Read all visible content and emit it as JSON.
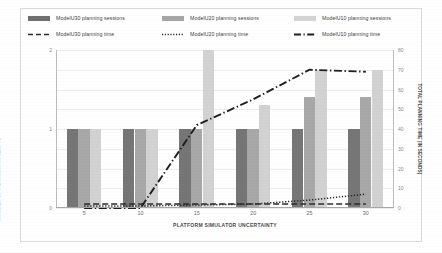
{
  "chart_data": {
    "type": "bar",
    "title": "",
    "xlabel": "PLATFORM SIMULATOR UNCERTAINTY",
    "ylabel": "NUMBER OF PLANNING ATTEMPTS",
    "y2label": "TOTAL PLANNING TIME (IN SECONDS)",
    "categories": [
      "5",
      "10",
      "15",
      "20",
      "25",
      "30"
    ],
    "x": [
      5,
      10,
      15,
      20,
      25,
      30
    ],
    "ylim": [
      0,
      2
    ],
    "y2lim": [
      0,
      80
    ],
    "yticks": [
      "0",
      "1",
      "2"
    ],
    "ytick_values": [
      0,
      1,
      2
    ],
    "y2ticks": [
      "0",
      "10",
      "20",
      "30",
      "40",
      "50",
      "60",
      "70",
      "80"
    ],
    "y2tick_values": [
      0,
      10,
      20,
      30,
      40,
      50,
      60,
      70,
      80
    ],
    "grid": true,
    "legend_position": "top",
    "series": [
      {
        "name": "ModelU30 planning sessions",
        "kind": "bar",
        "axis": "left",
        "color": "#767676",
        "values": [
          1,
          1,
          1,
          1,
          1,
          1
        ]
      },
      {
        "name": "ModelU20 planning sessions",
        "kind": "bar",
        "axis": "left",
        "color": "#a8a8a8",
        "values": [
          1,
          1,
          1,
          1,
          1.4,
          1.4
        ]
      },
      {
        "name": "ModelU10 planning sessions",
        "kind": "bar",
        "axis": "left",
        "color": "#d2d2d2",
        "values": [
          1,
          1,
          2,
          1.3,
          1.75,
          1.75
        ]
      },
      {
        "name": "ModelU30 planning time",
        "kind": "line",
        "axis": "right",
        "style": "dashed",
        "color": "#2b2b2b",
        "values": [
          2,
          2,
          2,
          2,
          2,
          2
        ]
      },
      {
        "name": "ModelU20 planning time",
        "kind": "line",
        "axis": "right",
        "style": "dotted",
        "color": "#2b2b2b",
        "values": [
          1,
          1,
          1.5,
          2,
          4,
          7
        ]
      },
      {
        "name": "ModelU10 planning time",
        "kind": "line",
        "axis": "right",
        "style": "dashdot",
        "color": "#1f1f1f",
        "values": [
          0,
          0,
          42,
          55,
          70,
          69
        ]
      }
    ]
  },
  "legend": {
    "columns": [
      {
        "bar_label": "ModelU30 planning sessions",
        "bar_swatch": "#6f6f6f",
        "line_label": "ModelU30 planning time",
        "line_style": "dashed"
      },
      {
        "bar_label": "ModelU20 planning sessions",
        "bar_swatch": "#a6a6a6",
        "line_label": "ModelU20 planning time",
        "line_style": "dotted"
      },
      {
        "bar_label": "ModelU10 planning sessions",
        "bar_swatch": "#d4d4d4",
        "line_label": "ModelU10 planning time",
        "line_style": "dashdot"
      }
    ]
  },
  "axes": {
    "x_title": "PLATFORM SIMULATOR UNCERTAINTY",
    "y_left_title": "NUMBER OF PLANNING ATTEMPTS",
    "y_right_title": "TOTAL PLANNING TIME (IN SECONDS)"
  }
}
